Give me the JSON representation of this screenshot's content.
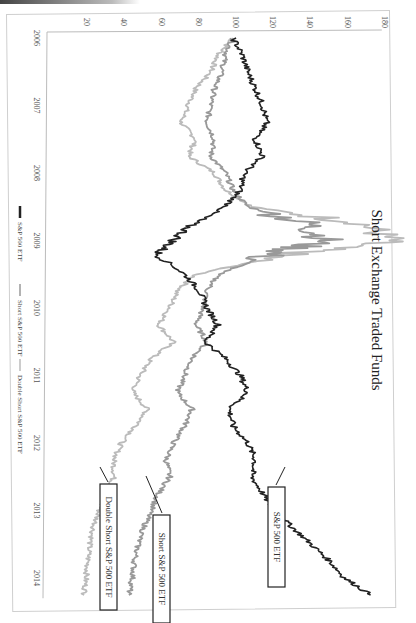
{
  "chart_data": {
    "type": "line",
    "title": "Short Exchange Traded Funds",
    "xlabel": "",
    "ylabel": "",
    "orientation": "rotated-90-clockwise",
    "x_ticks": [
      "2006",
      "2007",
      "2008",
      "2009",
      "2010",
      "2011",
      "2012",
      "2013",
      "2014"
    ],
    "y_ticks": [
      0,
      20,
      40,
      60,
      80,
      100,
      120,
      140,
      160,
      180
    ],
    "ylim": [
      0,
      180
    ],
    "xlim": [
      2006.0,
      2014.25
    ],
    "grid": false,
    "legend_position": "bottom",
    "x": [
      2006.0,
      2006.25,
      2006.5,
      2006.75,
      2007.0,
      2007.25,
      2007.5,
      2007.75,
      2008.0,
      2008.25,
      2008.5,
      2008.75,
      2009.0,
      2009.2,
      2009.5,
      2009.75,
      2010.0,
      2010.25,
      2010.5,
      2010.75,
      2011.0,
      2011.25,
      2011.5,
      2011.75,
      2012.0,
      2012.25,
      2012.5,
      2012.75,
      2013.0,
      2013.25,
      2013.5,
      2013.75,
      2014.0,
      2014.25
    ],
    "series": [
      {
        "name": "S&P 500 ETF",
        "color": "#222222",
        "values": [
          100,
          105,
          108,
          112,
          116,
          118,
          112,
          116,
          106,
          104,
          96,
          78,
          68,
          59,
          74,
          82,
          86,
          92,
          85,
          96,
          104,
          108,
          98,
          100,
          108,
          112,
          110,
          116,
          122,
          132,
          142,
          152,
          160,
          174
        ]
      },
      {
        "name": "Short S&P 500 ETF",
        "color": "#999999",
        "values": [
          100,
          96,
          94,
          90,
          88,
          86,
          90,
          88,
          96,
          100,
          108,
          140,
          150,
          120,
          92,
          86,
          84,
          80,
          86,
          78,
          74,
          70,
          78,
          74,
          68,
          64,
          66,
          60,
          56,
          52,
          49,
          47,
          46,
          44
        ]
      },
      {
        "name": "Double Short S&P 500 ETF",
        "color": "#bbbbbb",
        "values": [
          100,
          92,
          88,
          80,
          76,
          72,
          80,
          76,
          90,
          96,
          110,
          170,
          185,
          130,
          80,
          70,
          66,
          60,
          68,
          56,
          50,
          46,
          54,
          48,
          40,
          36,
          36,
          32,
          28,
          25,
          23,
          22,
          21,
          20
        ]
      }
    ],
    "annotations": [
      {
        "text": "S&P 500 ETF",
        "series": "S&P 500 ETF",
        "at_x": 2012.7
      },
      {
        "text": "Short S&P 500 ETF",
        "series": "Short S&P 500 ETF",
        "at_x": 2012.4
      },
      {
        "text": "Double Short S&P 500 ETF",
        "series": "Double Short S&P 500 ETF",
        "at_x": 2012.5
      }
    ]
  }
}
